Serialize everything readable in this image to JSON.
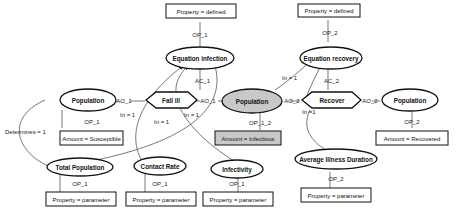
{
  "diagram": {
    "type": "ontology-concept-graph",
    "colors": {
      "stroke": "#111111",
      "highlight_fill": "#c8c8c8",
      "edge": "#555555"
    },
    "nodes": {
      "eq_infection": {
        "label": "Equation infection",
        "shape": "ellipse"
      },
      "prop_defined_1": {
        "label": "Property = defined",
        "shape": "box"
      },
      "op_1_top": {
        "label": "OP_1"
      },
      "ac_1": {
        "label": "AC_1"
      },
      "fall_ill": {
        "label": "Fall ill",
        "shape": "hexagon"
      },
      "pop_left": {
        "label": "Population",
        "shape": "ellipse"
      },
      "ao_1_left": {
        "label": "AO_1"
      },
      "ao_1_right": {
        "label": "AO_1"
      },
      "op_1_pop": {
        "label": "OP_1"
      },
      "amount_susceptible": {
        "label": "Amount = Susceptible",
        "shape": "box"
      },
      "determines": {
        "label": "Determines = 1"
      },
      "in1_a": {
        "label": "In = 1"
      },
      "in1_b": {
        "label": "In = 1"
      },
      "in1_c": {
        "label": "In = 1"
      },
      "total_pop": {
        "label": "Total Population",
        "shape": "ellipse"
      },
      "op_1_total": {
        "label": "OP_1"
      },
      "prop_param_total": {
        "label": "Property = parameter",
        "shape": "box"
      },
      "contact_rate": {
        "label": "Contact Rate",
        "shape": "ellipse"
      },
      "op_1_contact": {
        "label": "OP_1"
      },
      "prop_param_contact": {
        "label": "Property = parameter",
        "shape": "box"
      },
      "infectivity": {
        "label": "Infectivity",
        "shape": "ellipse"
      },
      "op_1_infect": {
        "label": "OP_1"
      },
      "prop_param_infect": {
        "label": "Property = parameter",
        "shape": "box"
      },
      "pop_mid": {
        "label": "Population",
        "shape": "ellipse",
        "highlighted": true
      },
      "op_1_2": {
        "label": "OP_1_2"
      },
      "amount_infectious": {
        "label": "Amount = Infectious",
        "shape": "box",
        "highlighted": true
      },
      "eq_recovery": {
        "label": "Equation recovery",
        "shape": "ellipse"
      },
      "prop_defined_2": {
        "label": "Property = defined",
        "shape": "box"
      },
      "op_2_top": {
        "label": "OP_2"
      },
      "ac_2": {
        "label": "AC_2"
      },
      "in1_rec": {
        "label": "In = 1"
      },
      "recover": {
        "label": "Recover",
        "shape": "hexagon"
      },
      "ao_2_left": {
        "label": "AO_2"
      },
      "ao_2_right": {
        "label": "AO_2"
      },
      "in1_dur": {
        "label": "In =1"
      },
      "pop_right": {
        "label": "Population",
        "shape": "ellipse"
      },
      "op_2_pop": {
        "label": "OP_2"
      },
      "amount_recovered": {
        "label": "Amount = Recovered",
        "shape": "box"
      },
      "avg_illness": {
        "label": "Average Illness Duration",
        "shape": "ellipse"
      },
      "op_2_dur": {
        "label": "OP_2"
      },
      "prop_param_dur": {
        "label": "Property = parameter",
        "shape": "box"
      }
    }
  }
}
